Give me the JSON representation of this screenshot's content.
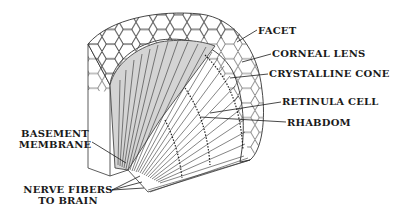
{
  "diagram": {
    "labels": {
      "facet": "FACET",
      "corneal_lens": "CORNEAL LENS",
      "crystalline_cone": "CRYSTALLINE CONE",
      "retinula_cell": "RETINULA CELL",
      "rhabdom": "RHABDOM",
      "basement_membrane_line1": "BASEMENT",
      "basement_membrane_line2": "MEMBRANE",
      "nerve_fibers_line1": "NERVE FIBERS",
      "nerve_fibers_line2": "TO BRAIN"
    },
    "colors": {
      "ink": "#1a1a1a",
      "shade": "#cfcfcf",
      "background": "#ffffff"
    }
  }
}
